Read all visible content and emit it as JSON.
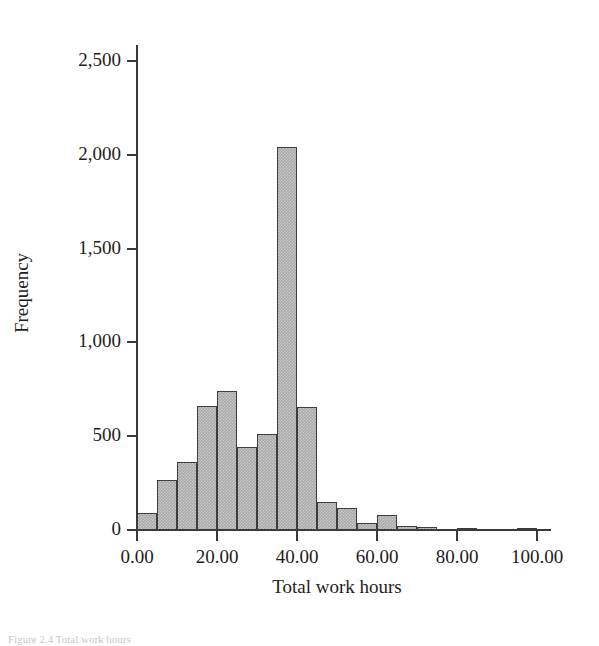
{
  "figure": {
    "caption_clipped": "Figure 2.4  Total work hours"
  },
  "chart_data": {
    "type": "bar",
    "title": "",
    "subtitle": "",
    "xlabel": "Total work hours",
    "ylabel": "Frequency",
    "xlim": [
      0,
      103.5
    ],
    "ylim": [
      0,
      2500
    ],
    "grid": false,
    "legend": null,
    "bin_width": 5,
    "x_tick_labels": [
      "0.00",
      "20.00",
      "40.00",
      "60.00",
      "80.00",
      "100.00"
    ],
    "x_tick_values": [
      0,
      20,
      40,
      60,
      80,
      100
    ],
    "y_tick_labels": [
      "0",
      "500",
      "1,000",
      "1,500",
      "2,000",
      "2,500"
    ],
    "y_tick_values": [
      0,
      500,
      1000,
      1500,
      2000,
      2500
    ],
    "bin_starts": [
      0,
      5,
      10,
      15,
      20,
      25,
      30,
      35,
      40,
      45,
      50,
      55,
      60,
      65,
      70,
      75,
      80,
      85,
      90,
      95
    ],
    "categories": [
      "0-5",
      "5-10",
      "10-15",
      "15-20",
      "20-25",
      "25-30",
      "30-35",
      "35-40",
      "40-45",
      "45-50",
      "50-55",
      "55-60",
      "60-65",
      "65-70",
      "70-75",
      "75-80",
      "80-85",
      "85-90",
      "90-95",
      "95-100"
    ],
    "values": [
      90,
      265,
      365,
      660,
      740,
      440,
      510,
      2040,
      655,
      150,
      120,
      40,
      80,
      20,
      15,
      0,
      10,
      0,
      0,
      10
    ],
    "colors": {
      "bar_fill": "#a9a9a9",
      "bar_edge": "#3d3d3d",
      "axis": "#3a3a3a",
      "text": "#1d1d1d",
      "background": "#ffffff"
    }
  }
}
